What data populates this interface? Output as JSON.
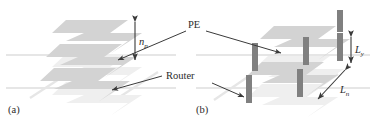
{
  "figure": {
    "background_color": "#ffffff",
    "width": 374,
    "height": 121,
    "colors": {
      "slab_fill": "#d3d3d3",
      "slab_fill_faint": "#ececec",
      "bar_fill": "#808080",
      "bar_fill_light": "#9a9a9a",
      "line": "#3a3a3a",
      "text": "#2b2b2b",
      "ghost_line": "#e2e2e2"
    }
  },
  "panels": [
    {
      "id": "a",
      "label": "(a)",
      "description": "stack of processing-element slabs with vertical pitch annotation"
    },
    {
      "id": "b",
      "label": "(b)",
      "description": "stack of slabs with vertical router bars and length annotations"
    }
  ],
  "annotations": {
    "np": {
      "base": "n",
      "sub": "p",
      "full": "n_p"
    },
    "pe": {
      "text": "PE"
    },
    "router": {
      "text": "Router"
    },
    "ly": {
      "base": "L",
      "sub": "y",
      "full": "L_y"
    },
    "ln": {
      "base": "L",
      "sub": "n",
      "full": "L_n"
    }
  },
  "icons": {
    "arrow_up_down": "double-headed-arrow-icon",
    "leader_line": "leader-line-icon"
  }
}
